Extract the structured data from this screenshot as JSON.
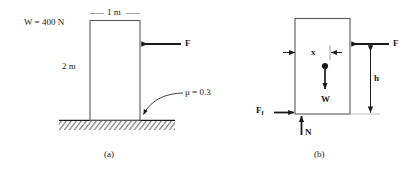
{
  "figure": {
    "type": "statics-free-body-diagram",
    "stroke_color": "#1a1a1a",
    "hatch_color": "#555555"
  },
  "panel_a": {
    "caption": "(a)",
    "weight_label": "W = 400 N",
    "width_label": "1 m",
    "height_label": "2 m",
    "force_label": "F",
    "friction_label": "μ = 0.3",
    "block": {
      "width_m": 1,
      "height_m": 2,
      "weight_N": 400
    },
    "surface": {
      "friction_coefficient": 0.3,
      "style": "hatched-ground"
    },
    "applied_force": {
      "label": "F",
      "direction": "left",
      "applied_side": "right-face"
    }
  },
  "panel_b": {
    "caption": "(b)",
    "force_label": "F",
    "weight_label": "W",
    "friction_label_main": "F",
    "friction_label_sub": "f",
    "normal_label": "N",
    "height_dim_label": "h",
    "offset_dim_label": "x",
    "vectors": [
      {
        "name": "applied-force",
        "label": "F",
        "direction": "left",
        "location": "upper-right-face"
      },
      {
        "name": "weight",
        "label": "W",
        "direction": "down",
        "location": "center-of-gravity"
      },
      {
        "name": "friction-force",
        "label": "Ff",
        "direction": "right",
        "location": "bottom-left-corner"
      },
      {
        "name": "normal-force",
        "label": "N",
        "direction": "up",
        "location": "bottom-face"
      }
    ],
    "dimensions": [
      {
        "name": "h",
        "label": "h",
        "orientation": "vertical",
        "description": "height of applied force above base"
      },
      {
        "name": "x",
        "label": "x",
        "orientation": "horizontal",
        "description": "offset of normal force from left edge"
      }
    ]
  }
}
